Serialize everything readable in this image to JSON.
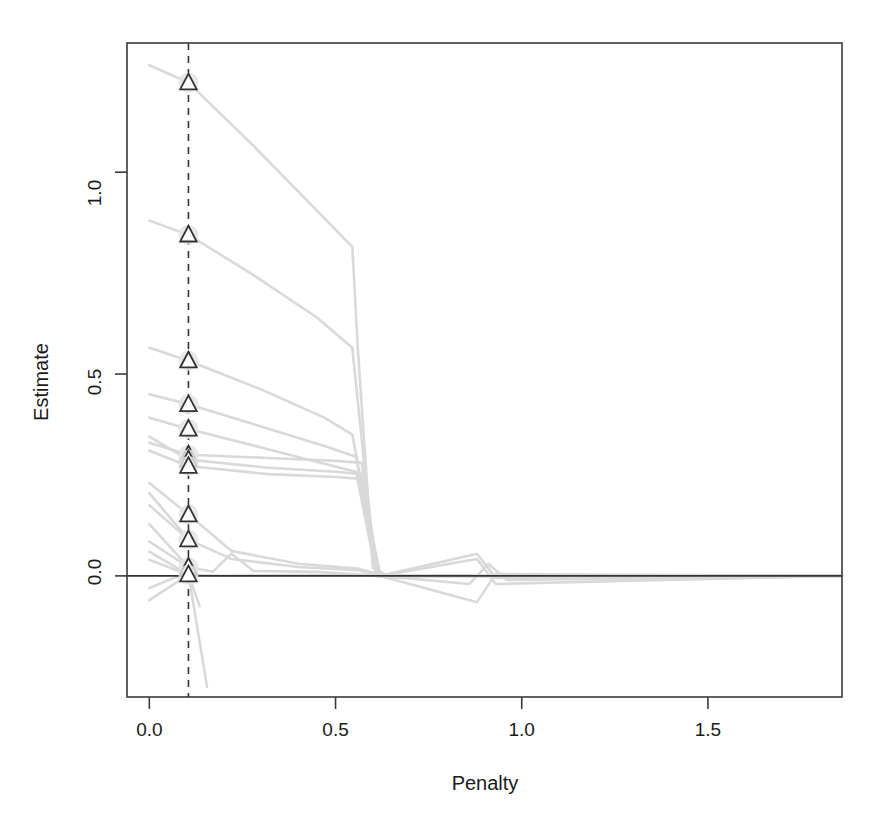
{
  "chart_data": {
    "type": "line",
    "title": "",
    "subtitle": "",
    "xlabel": "Penalty",
    "ylabel": "Estimate",
    "xlim": [
      -0.06,
      1.86
    ],
    "ylim": [
      -0.3,
      1.32
    ],
    "xticks": [
      0.0,
      0.5,
      1.0,
      1.5
    ],
    "xticklabels": [
      "0.0",
      "0.5",
      "1.0",
      "1.5"
    ],
    "yticks": [
      0.0,
      0.5,
      1.0
    ],
    "yticklabels": [
      "0.0",
      "0.5",
      "1.0"
    ],
    "grid": false,
    "legend": null,
    "line_color": "#d9d9d9",
    "marker_color": "#333333",
    "marker_fill": "#ffffff",
    "marker_halo": "#e4e4e4",
    "axis_color": "#3a3a3a",
    "reference_lines": [
      {
        "name": "selected-penalty",
        "orientation": "vertical",
        "x": 0.105,
        "style": "dashed",
        "color": "#333333"
      },
      {
        "name": "zero-estimate",
        "orientation": "horizontal",
        "y": 0.0,
        "style": "solid",
        "color": "#333333"
      }
    ],
    "marker_points": [
      {
        "x": 0.105,
        "y": 1.222
      },
      {
        "x": 0.105,
        "y": 0.845
      },
      {
        "x": 0.105,
        "y": 0.533
      },
      {
        "x": 0.105,
        "y": 0.425
      },
      {
        "x": 0.105,
        "y": 0.364
      },
      {
        "x": 0.105,
        "y": 0.3
      },
      {
        "x": 0.105,
        "y": 0.288
      },
      {
        "x": 0.105,
        "y": 0.272
      },
      {
        "x": 0.105,
        "y": 0.152
      },
      {
        "x": 0.105,
        "y": 0.09
      },
      {
        "x": 0.105,
        "y": 0.022
      },
      {
        "x": 0.105,
        "y": 0.003
      }
    ],
    "series": [
      {
        "name": "path-1",
        "x": [
          0.0,
          0.105,
          0.28,
          0.45,
          0.545,
          0.56,
          0.6,
          0.64,
          0.9,
          1.86
        ],
        "values": [
          1.265,
          1.222,
          1.065,
          0.905,
          0.815,
          0.56,
          0.02,
          0.0,
          0.0,
          0.0
        ]
      },
      {
        "name": "path-2",
        "x": [
          0.0,
          0.105,
          0.28,
          0.45,
          0.545,
          0.58,
          0.61,
          0.9,
          1.86
        ],
        "values": [
          0.88,
          0.845,
          0.745,
          0.64,
          0.565,
          0.25,
          0.0,
          0.0,
          0.0
        ]
      },
      {
        "name": "path-3",
        "x": [
          0.0,
          0.105,
          0.3,
          0.47,
          0.545,
          0.59,
          0.61,
          0.9,
          1.86
        ],
        "values": [
          0.565,
          0.533,
          0.462,
          0.392,
          0.35,
          0.13,
          0.0,
          0.0,
          0.0
        ]
      },
      {
        "name": "path-4",
        "x": [
          0.0,
          0.105,
          0.3,
          0.47,
          0.555,
          0.59,
          0.61,
          0.9,
          1.86
        ],
        "values": [
          0.45,
          0.425,
          0.37,
          0.322,
          0.295,
          0.11,
          0.0,
          0.0,
          0.0
        ]
      },
      {
        "name": "path-5",
        "x": [
          0.0,
          0.105,
          0.3,
          0.47,
          0.555,
          0.59,
          0.61,
          0.9,
          1.86
        ],
        "values": [
          0.392,
          0.364,
          0.318,
          0.278,
          0.258,
          0.095,
          0.0,
          0.0,
          0.0
        ]
      },
      {
        "name": "path-6",
        "x": [
          0.0,
          0.105,
          0.32,
          0.5,
          0.57,
          0.6,
          0.62,
          0.88,
          0.92,
          1.86
        ],
        "values": [
          0.33,
          0.3,
          0.292,
          0.285,
          0.28,
          0.095,
          0.0,
          0.0,
          0.0,
          0.0
        ]
      },
      {
        "name": "path-7",
        "x": [
          0.0,
          0.105,
          0.32,
          0.5,
          0.57,
          0.6,
          0.62,
          0.88,
          0.93,
          1.86
        ],
        "values": [
          0.345,
          0.288,
          0.268,
          0.258,
          0.252,
          0.085,
          0.0,
          0.055,
          -0.005,
          0.0
        ]
      },
      {
        "name": "path-8",
        "x": [
          0.0,
          0.105,
          0.32,
          0.5,
          0.57,
          0.6,
          0.62,
          0.88,
          0.93,
          1.86
        ],
        "values": [
          0.31,
          0.272,
          0.252,
          0.245,
          0.24,
          0.08,
          0.0,
          -0.065,
          0.005,
          0.0
        ]
      },
      {
        "name": "path-9",
        "x": [
          0.0,
          0.105,
          0.22,
          0.4,
          0.56,
          0.6,
          0.62,
          0.9,
          1.86
        ],
        "values": [
          0.23,
          0.152,
          0.062,
          0.03,
          0.018,
          0.008,
          0.0,
          0.0,
          0.0
        ]
      },
      {
        "name": "path-10",
        "x": [
          0.0,
          0.105,
          0.22,
          0.4,
          0.56,
          0.6,
          0.62,
          0.9,
          1.86
        ],
        "values": [
          0.175,
          0.09,
          0.042,
          0.022,
          0.014,
          0.006,
          0.0,
          0.0,
          0.0
        ]
      },
      {
        "name": "path-11",
        "x": [
          0.0,
          0.105,
          0.17,
          0.22,
          0.28,
          0.45,
          0.62,
          0.88,
          0.93,
          1.86
        ],
        "values": [
          0.085,
          0.022,
          0.01,
          0.055,
          0.012,
          0.01,
          0.0,
          0.042,
          -0.02,
          0.0
        ]
      },
      {
        "name": "path-12",
        "x": [
          0.0,
          0.105,
          0.2,
          0.35,
          0.55,
          0.62,
          0.86,
          0.91,
          0.96,
          1.86
        ],
        "values": [
          0.04,
          0.003,
          0.0,
          0.002,
          0.002,
          0.0,
          -0.02,
          0.03,
          -0.01,
          0.0
        ]
      },
      {
        "name": "path-13",
        "x": [
          0.0,
          0.105,
          0.135
        ],
        "values": [
          0.06,
          0.003,
          -0.075
        ]
      },
      {
        "name": "path-14",
        "x": [
          0.105,
          0.155
        ],
        "values": [
          0.005,
          -0.275
        ]
      },
      {
        "name": "path-15",
        "x": [
          0.0,
          0.105
        ],
        "values": [
          -0.06,
          0.003
        ]
      },
      {
        "name": "path-16",
        "x": [
          0.0,
          0.105
        ],
        "values": [
          -0.03,
          0.01
        ]
      },
      {
        "name": "path-17",
        "x": [
          0.0,
          0.105
        ],
        "values": [
          0.205,
          0.09
        ]
      },
      {
        "name": "path-18",
        "x": [
          0.0,
          0.105
        ],
        "values": [
          0.128,
          0.022
        ]
      }
    ]
  }
}
